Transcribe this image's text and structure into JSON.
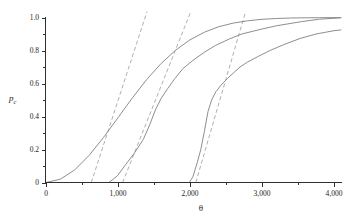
{
  "figure": {
    "background": "#ffffff",
    "axis_color": "#303030",
    "text_color": "#1d1d1d",
    "solid_curve_color": "#8e8e8e",
    "dashed_curve_color": "#b0b0b0"
  },
  "axes": {
    "x": {
      "label": "θ",
      "major_ticks": [
        {
          "value": 0,
          "label": "0"
        },
        {
          "value": 1000,
          "label": "1,000"
        },
        {
          "value": 2000,
          "label": "2,000"
        },
        {
          "value": 3000,
          "label": "3,000"
        },
        {
          "value": 4000,
          "label": "4,000"
        }
      ],
      "minor_ticks": [
        500,
        1500,
        2500,
        3500
      ]
    },
    "y": {
      "label": "p",
      "label_sub": "c",
      "major_ticks": [
        {
          "value": 0,
          "label": "0"
        },
        {
          "value": 0.2,
          "label": "0.2"
        },
        {
          "value": 0.4,
          "label": "0.4"
        },
        {
          "value": 0.6,
          "label": "0.6"
        },
        {
          "value": 0.8,
          "label": "0.8"
        },
        {
          "value": 1.0,
          "label": "1.0"
        }
      ],
      "minor_ticks": [
        0.1,
        0.3,
        0.5,
        0.7,
        0.9
      ]
    }
  },
  "chart_data": {
    "type": "line",
    "title": "",
    "xlabel": "θ",
    "ylabel": "p_c",
    "xlim": [
      0,
      4100
    ],
    "ylim": [
      0,
      1.04
    ],
    "grid": false,
    "legend": "none",
    "series": [
      {
        "name": "curve-1",
        "style": "solid",
        "color": "#8e8e8e",
        "x": [
          0,
          200,
          400,
          600,
          800,
          1000,
          1200,
          1400,
          1600,
          1800,
          2000,
          2200,
          2400,
          2600,
          2800,
          3000,
          3200,
          3400,
          3600,
          3800,
          4000,
          4100
        ],
        "y": [
          0,
          0.02,
          0.077,
          0.165,
          0.274,
          0.393,
          0.513,
          0.625,
          0.722,
          0.802,
          0.865,
          0.911,
          0.944,
          0.966,
          0.98,
          0.989,
          0.994,
          0.997,
          0.998,
          0.999,
          0.9995,
          1.0
        ]
      },
      {
        "name": "curve-2",
        "style": "solid",
        "color": "#8e8e8e",
        "x": [
          875,
          990,
          1110,
          1230,
          1350,
          1440,
          1520,
          1600,
          1690,
          1790,
          1900,
          2040,
          2200,
          2350,
          2550,
          2720,
          3000,
          3200,
          3550,
          3800,
          4100
        ],
        "y": [
          0,
          0.04,
          0.11,
          0.18,
          0.26,
          0.35,
          0.44,
          0.51,
          0.57,
          0.63,
          0.69,
          0.74,
          0.79,
          0.83,
          0.87,
          0.9,
          0.93,
          0.95,
          0.975,
          0.99,
          0.998
        ]
      },
      {
        "name": "curve-3",
        "style": "solid",
        "color": "#8e8e8e",
        "x": [
          1990,
          2040,
          2100,
          2150,
          2200,
          2250,
          2300,
          2360,
          2430,
          2520,
          2620,
          2694,
          2800,
          2950,
          3111,
          3300,
          3528,
          3750,
          4000,
          4100
        ],
        "y": [
          0,
          0.035,
          0.12,
          0.2,
          0.31,
          0.43,
          0.5,
          0.55,
          0.59,
          0.63,
          0.67,
          0.7,
          0.73,
          0.765,
          0.8,
          0.835,
          0.873,
          0.9,
          0.92,
          0.925
        ]
      },
      {
        "name": "approx-line-1",
        "style": "dashed",
        "color": "#b0b0b0",
        "x": [
          629,
          1403
        ],
        "y": [
          0,
          1.036
        ]
      },
      {
        "name": "approx-line-2",
        "style": "dashed",
        "color": "#b0b0b0",
        "x": [
          1064,
          2011
        ],
        "y": [
          0,
          1.036
        ]
      },
      {
        "name": "approx-line-3",
        "style": "dashed",
        "color": "#b0b0b0",
        "x": [
          2081,
          2772
        ],
        "y": [
          0,
          1.036
        ]
      }
    ]
  }
}
